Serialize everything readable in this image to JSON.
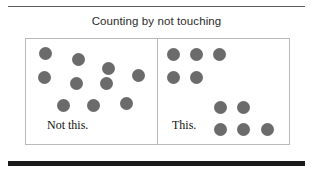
{
  "slide": {
    "title": "Counting by not touching",
    "background_color": "#ffffff"
  },
  "rules": {
    "top_color": "#5b5b5b",
    "bottom_color": "#1a1a1a"
  },
  "diagram": {
    "dot_color": "#6b6b6b",
    "border_color": "#b9b9b9",
    "panels": [
      {
        "id": "left",
        "caption": "Not this.",
        "arrangement": "scattered",
        "dot_count": 10,
        "dots": [
          {
            "x": 13,
            "y": 8,
            "d": 13
          },
          {
            "x": 46,
            "y": 14,
            "d": 13
          },
          {
            "x": 76,
            "y": 23,
            "d": 13
          },
          {
            "x": 12,
            "y": 32,
            "d": 13
          },
          {
            "x": 106,
            "y": 30,
            "d": 13
          },
          {
            "x": 44,
            "y": 38,
            "d": 13
          },
          {
            "x": 74,
            "y": 38,
            "d": 13
          },
          {
            "x": 31,
            "y": 60,
            "d": 13
          },
          {
            "x": 61,
            "y": 60,
            "d": 13
          },
          {
            "x": 94,
            "y": 58,
            "d": 13
          }
        ]
      },
      {
        "id": "right",
        "caption": "This.",
        "arrangement": "grouped",
        "dot_count": 10,
        "groups": [
          {
            "name": "top-left-group",
            "count": 5
          },
          {
            "name": "bottom-right-group",
            "count": 5
          }
        ],
        "dots": [
          {
            "x": 9,
            "y": 9,
            "d": 13
          },
          {
            "x": 32,
            "y": 9,
            "d": 13
          },
          {
            "x": 55,
            "y": 9,
            "d": 13
          },
          {
            "x": 9,
            "y": 32,
            "d": 13
          },
          {
            "x": 32,
            "y": 32,
            "d": 13
          },
          {
            "x": 56,
            "y": 62,
            "d": 13
          },
          {
            "x": 79,
            "y": 62,
            "d": 13
          },
          {
            "x": 56,
            "y": 84,
            "d": 13
          },
          {
            "x": 79,
            "y": 84,
            "d": 13
          },
          {
            "x": 103,
            "y": 84,
            "d": 13
          }
        ]
      }
    ]
  }
}
